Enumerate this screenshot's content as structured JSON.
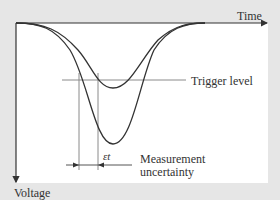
{
  "diagram": {
    "axes": {
      "x_label": "Time",
      "y_label": "Voltage"
    },
    "annotations": {
      "trigger_level": "Trigger level",
      "measurement_line1": "Measurement",
      "measurement_line2": "uncertainty",
      "epsilon_t": "εt"
    },
    "colors": {
      "background": "#e6e6e6",
      "panel": "#ffffff",
      "curve": "#333333",
      "guide": "#8a8a8a"
    }
  }
}
